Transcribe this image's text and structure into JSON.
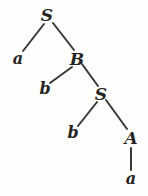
{
  "figure": {
    "type": "parse-tree",
    "background_color": "#fdfdfc",
    "ink_color": "#272524",
    "edge_color": "#3a3836",
    "edge_width": 2.0
  },
  "nodes": [
    {
      "id": "n0",
      "label": "S",
      "kind": "nonterminal",
      "x": 47,
      "y": 15,
      "depth": 0
    },
    {
      "id": "n1",
      "label": "a",
      "kind": "terminal",
      "x": 18,
      "y": 59,
      "depth": 1
    },
    {
      "id": "n2",
      "label": "B",
      "kind": "nonterminal",
      "x": 77,
      "y": 59,
      "depth": 1
    },
    {
      "id": "n3",
      "label": "b",
      "kind": "terminal",
      "x": 45,
      "y": 89,
      "depth": 2
    },
    {
      "id": "n4",
      "label": "S",
      "kind": "nonterminal",
      "x": 101,
      "y": 94,
      "depth": 2
    },
    {
      "id": "n5",
      "label": "b",
      "kind": "terminal",
      "x": 73,
      "y": 133,
      "depth": 3
    },
    {
      "id": "n6",
      "label": "A",
      "kind": "nonterminal",
      "x": 131,
      "y": 138,
      "depth": 3
    },
    {
      "id": "n7",
      "label": "a",
      "kind": "terminal",
      "x": 131,
      "y": 179,
      "depth": 4
    }
  ],
  "edges": [
    {
      "id": "e0",
      "from": "n0",
      "to": "n1",
      "x1": 44,
      "y1": 24,
      "x2": 23,
      "y2": 51
    },
    {
      "id": "e1",
      "from": "n0",
      "to": "n2",
      "x1": 53,
      "y1": 23,
      "x2": 74,
      "y2": 50
    },
    {
      "id": "e2",
      "from": "n2",
      "to": "n3",
      "x1": 72,
      "y1": 67,
      "x2": 50,
      "y2": 83
    },
    {
      "id": "e3",
      "from": "n2",
      "to": "n4",
      "x1": 82,
      "y1": 64,
      "x2": 98,
      "y2": 86
    },
    {
      "id": "e4",
      "from": "n4",
      "to": "n5",
      "x1": 97,
      "y1": 102,
      "x2": 78,
      "y2": 126
    },
    {
      "id": "e5",
      "from": "n4",
      "to": "n6",
      "x1": 106,
      "y1": 100,
      "x2": 127,
      "y2": 129
    },
    {
      "id": "e6",
      "from": "n6",
      "to": "n7",
      "x1": 131,
      "y1": 148,
      "x2": 131,
      "y2": 170
    }
  ],
  "derivation": {
    "root": "S",
    "yield": "a b b a",
    "productions": [
      "S -> a B",
      "B -> b S",
      "S -> b A",
      "A -> a"
    ]
  }
}
